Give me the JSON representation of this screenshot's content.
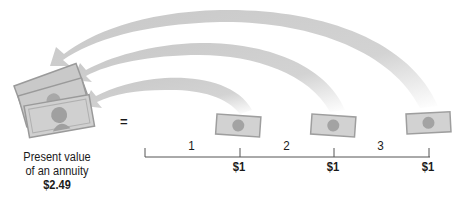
{
  "diagram": {
    "title": "Present value of an annuity",
    "present_value": {
      "label_line1": "Present value",
      "label_line2": "of an annuity",
      "amount": "$2.49"
    },
    "equals_sign": "=",
    "timeline": {
      "periods": [
        "1",
        "2",
        "3"
      ],
      "payments": [
        "$1",
        "$1",
        "$1"
      ]
    },
    "colors": {
      "arrow": "#cfcfcf",
      "bill_fill": "#c9c9c9",
      "bill_dark": "#9a9a9a",
      "line": "#555555",
      "text": "#1a1a1a"
    }
  }
}
